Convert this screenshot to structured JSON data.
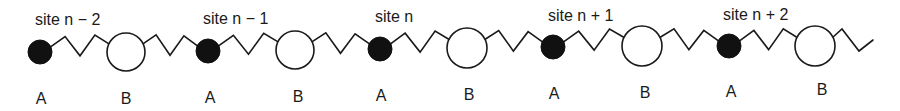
{
  "diagram": {
    "colors": {
      "ink": "#1a1a1a",
      "atom_a_fill": "#111111",
      "atom_b_fill": "#ffffff",
      "background": "#ffffff"
    },
    "sites": [
      {
        "label": "site n − 2",
        "label_x": 35,
        "label_y": 25
      },
      {
        "label": "site n − 1",
        "label_x": 203,
        "label_y": 24
      },
      {
        "label": "site n",
        "label_x": 375,
        "label_y": 22
      },
      {
        "label": "site n + 1",
        "label_x": 548,
        "label_y": 21
      },
      {
        "label": "site n + 2",
        "label_x": 723,
        "label_y": 20
      }
    ],
    "atoms": [
      {
        "type": "A",
        "label": "A",
        "cx": 40,
        "cy": 52,
        "r": 12,
        "label_x": 41,
        "label_y": 104
      },
      {
        "type": "B",
        "label": "B",
        "cx": 126,
        "cy": 52,
        "r": 19,
        "label_x": 126,
        "label_y": 104
      },
      {
        "type": "A",
        "label": "A",
        "cx": 208,
        "cy": 51,
        "r": 12,
        "label_x": 210,
        "label_y": 103
      },
      {
        "type": "B",
        "label": "B",
        "cx": 295,
        "cy": 50,
        "r": 19,
        "label_x": 298,
        "label_y": 102
      },
      {
        "type": "A",
        "label": "A",
        "cx": 380,
        "cy": 49,
        "r": 12,
        "label_x": 381,
        "label_y": 101
      },
      {
        "type": "B",
        "label": "B",
        "cx": 467,
        "cy": 48,
        "r": 20,
        "label_x": 469,
        "label_y": 100
      },
      {
        "type": "A",
        "label": "A",
        "cx": 553,
        "cy": 47,
        "r": 12,
        "label_x": 554,
        "label_y": 99
      },
      {
        "type": "B",
        "label": "B",
        "cx": 642,
        "cy": 46,
        "r": 20,
        "label_x": 645,
        "label_y": 98
      },
      {
        "type": "A",
        "label": "A",
        "cx": 729,
        "cy": 46,
        "r": 12,
        "label_x": 731,
        "label_y": 97
      },
      {
        "type": "B",
        "label": "B",
        "cx": 815,
        "cy": 46,
        "r": 20,
        "label_x": 822,
        "label_y": 95
      }
    ],
    "springs": {
      "peaks_per_spring": 2,
      "amplitude": 10,
      "trailing_end": {
        "x1": 835,
        "y1": 46,
        "x2": 873,
        "y2": 40
      }
    }
  }
}
